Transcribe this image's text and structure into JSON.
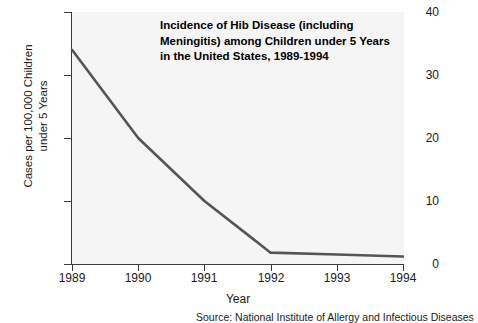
{
  "chart_data": {
    "type": "line",
    "title": "Incidence of Hib Disease (including Meningitis) among Children under 5 Years in the United States, 1989-1994",
    "title_lines": [
      "Incidence of Hib Disease (including",
      "Meningitis) among Children under 5 Years",
      "in the United States, 1989-1994"
    ],
    "xlabel": "Year",
    "ylabel": "Cases per 100,000 Children under 5 Years",
    "ylabel_lines": [
      "Cases per 100,000 Children",
      "under 5 Years"
    ],
    "categories": [
      "1989",
      "1990",
      "1991",
      "1992",
      "1993",
      "1994"
    ],
    "x": [
      1989,
      1990,
      1991,
      1992,
      1993,
      1994
    ],
    "values": [
      34,
      20,
      10,
      1.8,
      1.5,
      1.2
    ],
    "series": [
      {
        "name": "Hib disease incidence",
        "values": [
          34,
          20,
          10,
          1.8,
          1.5,
          1.2
        ]
      }
    ],
    "xlim": [
      1989,
      1994
    ],
    "ylim": [
      0,
      40
    ],
    "ytick_labels": [
      "40",
      "30",
      "20",
      "10",
      "0"
    ],
    "yticks": [
      40,
      30,
      20,
      10,
      0
    ],
    "xtick_labels": [
      "1989",
      "1990",
      "1991",
      "1992",
      "1993",
      "1994"
    ],
    "grid": false,
    "legend": "none",
    "colors": {
      "line": "#555555",
      "plot_background": "#f5f5f5",
      "axis": "#3a3a3a",
      "text": "#1a1a1a",
      "page_background": "#ffffff"
    }
  },
  "source": {
    "note": "Source: National Institute of Allergy and Infectious Diseases"
  }
}
